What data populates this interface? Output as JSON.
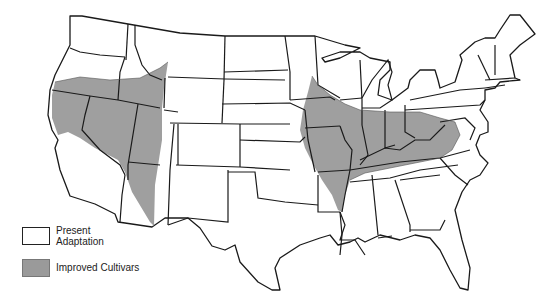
{
  "figure": {
    "type": "map",
    "region": "Contiguous United States",
    "colors": {
      "present_adaptation": "#ffffff",
      "improved_cultivars": "#9a9a9a",
      "state_border": "#1a1a1a"
    }
  },
  "legend": {
    "items": [
      {
        "key": "present_adaptation",
        "label_line1": "Present",
        "label_line2": "Adaptation"
      },
      {
        "key": "improved_cultivars",
        "label_line1": "Improved Cultivars",
        "label_line2": ""
      }
    ]
  },
  "regions": {
    "improved_cultivars_west": "Southern Oregon, southern Idaho, northern California, Nevada, Utah, northwestern Arizona",
    "improved_cultivars_east": "Eastern Iowa/Missouri, Illinois, Indiana, Ohio, Kentucky, Tennessee, West Virginia, northern Arkansas"
  }
}
